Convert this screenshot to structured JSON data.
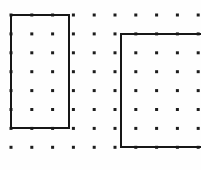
{
  "figure": {
    "width": 201,
    "height": 170,
    "background_color": "#fefefe"
  },
  "grid": {
    "name": "dot-lattice",
    "columns": 10,
    "rows": 8,
    "x_start": 11,
    "y_start": 15,
    "x_spacing": 20.8,
    "y_spacing": 18.9,
    "dot_size": 3,
    "dot_color": "#1c1c1c",
    "x_positions": [
      11,
      31,
      50,
      69,
      89,
      101,
      121,
      140,
      160,
      179,
      198
    ],
    "y_positions": [
      15,
      34,
      53,
      72,
      91,
      110,
      128,
      147
    ]
  },
  "shapes": [
    {
      "name": "rectangle-left",
      "label": "Rectangle 1",
      "stroke_color": "#171717",
      "stroke_width": 2,
      "clipped": false,
      "left": 11,
      "top": 15,
      "right": 69,
      "bottom": 128,
      "col_span": [
        1,
        4
      ],
      "row_span": [
        1,
        7
      ]
    },
    {
      "name": "rectangle-right",
      "label": "Rectangle 2",
      "stroke_color": "#171717",
      "stroke_width": 2,
      "clipped": true,
      "left": 121,
      "top": 34,
      "right": 201,
      "bottom": 147,
      "col_span": [
        7,
        10
      ],
      "row_span": [
        2,
        8
      ]
    }
  ]
}
